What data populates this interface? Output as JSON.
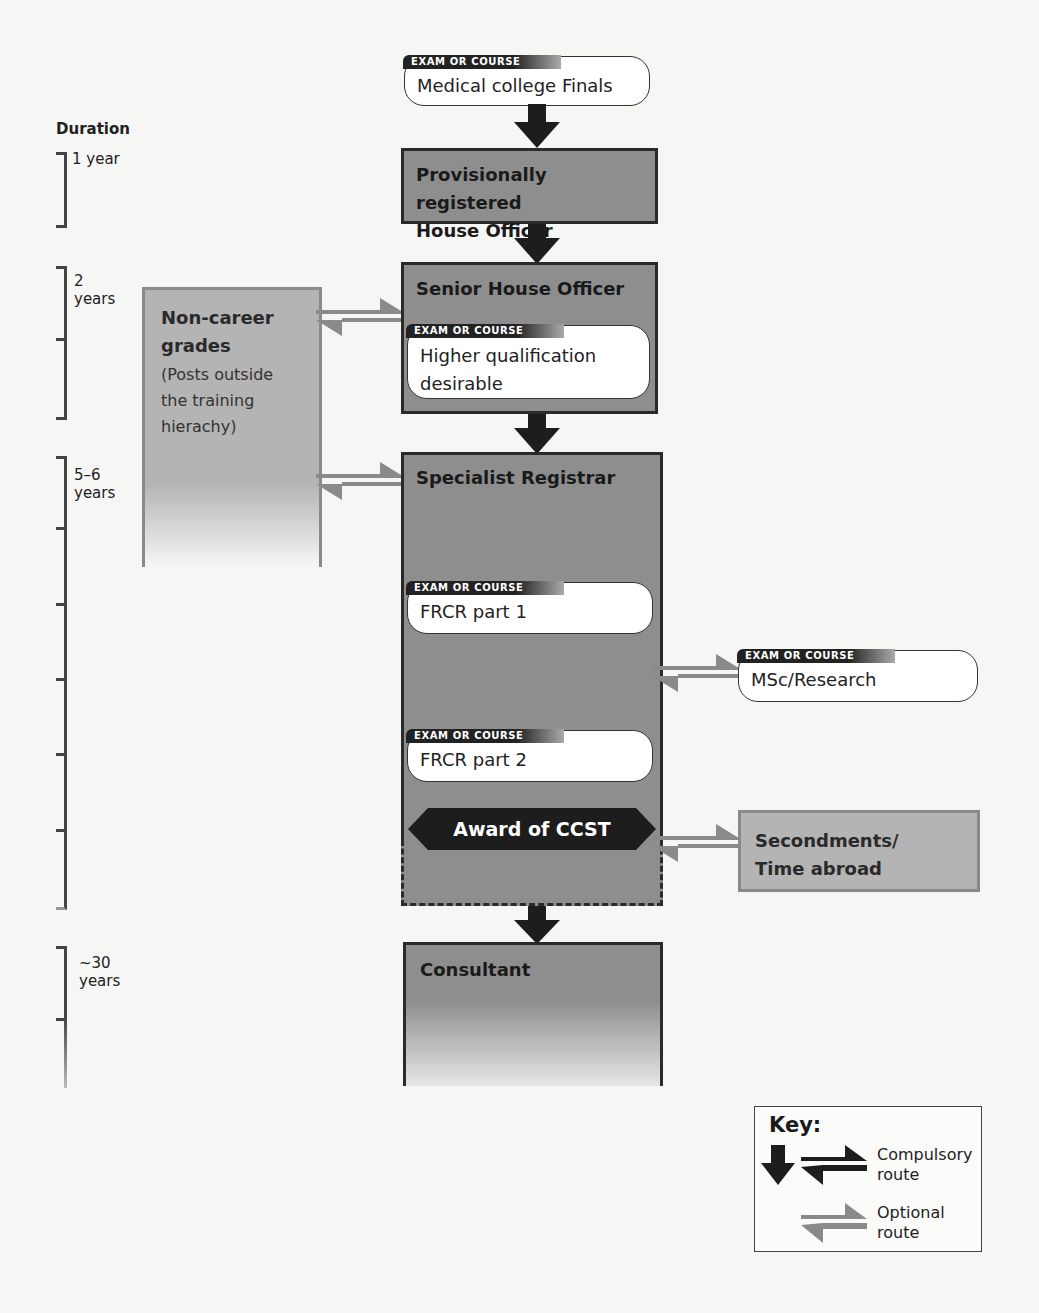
{
  "duration": {
    "title": "Duration",
    "segments": [
      {
        "label": "1 year"
      },
      {
        "label": "2\nyears",
        "l1": "2",
        "l2": "years"
      },
      {
        "label": "5–6 years",
        "l1": "5–6",
        "l2": "years"
      },
      {
        "label": "~30 years",
        "l1": "~30",
        "l2": "years"
      }
    ]
  },
  "exam_tag": "EXAM OR COURSE",
  "nodes": {
    "finals": "Medical college Finals",
    "house_officer_l1": "Provisionally registered",
    "house_officer_l2": "House Officer",
    "sho": "Senior House Officer",
    "sho_exam_l1": "Higher qualification",
    "sho_exam_l2": "desirable",
    "non_career_l1": "Non-career",
    "non_career_l2": "grades",
    "non_career_sub1": "(Posts outside",
    "non_career_sub2": "the training",
    "non_career_sub3": "hierachy)",
    "spr": "Specialist Registrar",
    "frcr1": "FRCR part 1",
    "msc": "MSc/Research",
    "frcr2": "FRCR part 2",
    "ccst": "Award of CCST",
    "secondments_l1": "Secondments/",
    "secondments_l2": "Time abroad",
    "consultant": "Consultant"
  },
  "key": {
    "title": "Key:",
    "compulsory_l1": "Compulsory",
    "compulsory_l2": "route",
    "optional_l1": "Optional",
    "optional_l2": "route"
  },
  "colors": {
    "grade_fill": "#8e8e8e",
    "non_career_fill": "#b4b4b4",
    "compulsory_arrow": "#1d1d1d",
    "optional_arrow": "#8a8a8a"
  }
}
